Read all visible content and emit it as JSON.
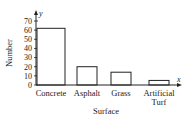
{
  "chart_data": {
    "type": "bar",
    "title": "",
    "xlabel": "Surface",
    "ylabel": "Number",
    "x_axis_letter": "x",
    "y_axis_letter": "y",
    "categories": [
      "Concrete",
      "Asphalt",
      "Grass",
      "Artificial Turf"
    ],
    "category_lines": [
      [
        "Concrete"
      ],
      [
        "Asphalt"
      ],
      [
        "Grass"
      ],
      [
        "Artificial",
        "Turf"
      ]
    ],
    "values": [
      62,
      20,
      14,
      5
    ],
    "ylim": [
      0,
      70
    ],
    "yticks": [
      0,
      10,
      20,
      30,
      40,
      50,
      60,
      70
    ],
    "grid": false,
    "legend": null,
    "bar_fill": "#ffffff",
    "bar_stroke": "#222222"
  }
}
